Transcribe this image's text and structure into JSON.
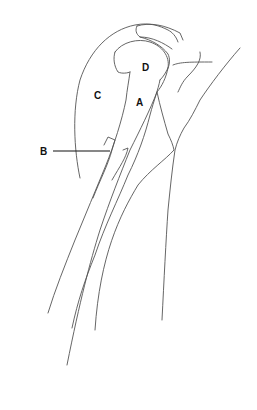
{
  "diagram": {
    "labels": [
      {
        "id": "A",
        "text": "A"
      },
      {
        "id": "B",
        "text": "B"
      },
      {
        "id": "C",
        "text": "C"
      },
      {
        "id": "D",
        "text": "D"
      }
    ],
    "colors": {
      "line": "#555555",
      "label": "#111111",
      "background": "#ffffff"
    }
  }
}
